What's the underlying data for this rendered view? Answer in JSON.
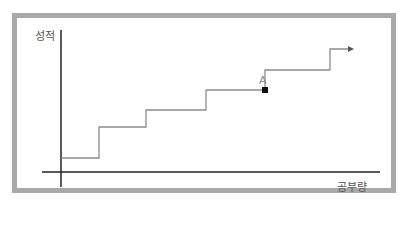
{
  "diagram": {
    "y_axis_label": "성적",
    "x_axis_label": "공부량",
    "point_label": "A",
    "colors": {
      "frame": "#a9a9a9",
      "axis": "#222222",
      "line": "#8c8c8c",
      "point": "#111111",
      "text": "#555555"
    },
    "step_path": [
      [
        61,
        158
      ],
      [
        99,
        158
      ],
      [
        99,
        127
      ],
      [
        146,
        127
      ],
      [
        146,
        110
      ],
      [
        206,
        110
      ],
      [
        206,
        90
      ],
      [
        265,
        90
      ],
      [
        265,
        70
      ],
      [
        330,
        70
      ],
      [
        330,
        49
      ],
      [
        350,
        49
      ]
    ],
    "point_A": [
      265,
      90
    ]
  }
}
